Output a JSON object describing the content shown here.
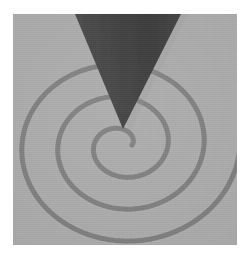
{
  "image": {
    "kind": "photograph",
    "subject": "spiral-with-cone",
    "width": 249,
    "height": 264,
    "background_color": "#ffffff"
  },
  "panel": {
    "name": "gray-square-panel",
    "x": 13,
    "y": 14,
    "width": 224,
    "height": 231,
    "fill_color": "#a9a9a9",
    "edge_color": "#9a9a9a"
  },
  "spiral": {
    "name": "engraved-spiral-groove",
    "center_x": 122,
    "center_y": 145,
    "turns": 3,
    "stroke_color": "#7b7b7b",
    "stroke_width": 5,
    "max_radius_x": 118,
    "max_radius_y": 104,
    "start_radius_x": 10,
    "start_radius_y": 8,
    "start_angle_deg": 0,
    "direction": "counterclockwise",
    "highlight_color": "#bdbdbd"
  },
  "cone": {
    "name": "dark-cone-pointer",
    "fill_color": "#3b3b3b",
    "apex_x": 123,
    "apex_y": 129,
    "top_left_x": 75,
    "top_right_x": 181,
    "top_y": 14,
    "shadow_color": "#8e8e8e"
  },
  "labels": {
    "caption": ""
  }
}
